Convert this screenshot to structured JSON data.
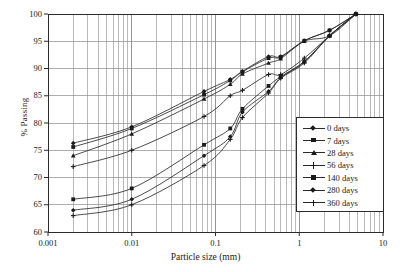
{
  "chart_data": {
    "type": "line",
    "title": "",
    "xlabel": "Particle size (mm)",
    "ylabel": "% Passing",
    "xscale": "log",
    "xlim": [
      0.001,
      10
    ],
    "ylim": [
      60,
      100
    ],
    "yticks": [
      60,
      65,
      70,
      75,
      80,
      85,
      90,
      95,
      100
    ],
    "xticks": [
      0.001,
      0.01,
      0.1,
      1,
      10
    ],
    "xtick_labels": [
      "0.001",
      "0.01",
      "0.1",
      "1",
      "10"
    ],
    "grid": "major-and-minor-log",
    "legend_position": "right-inside",
    "series": [
      {
        "name": "0 days",
        "marker": "diamond",
        "x": [
          0.002,
          0.01,
          0.073,
          0.15,
          0.21,
          0.43,
          0.6,
          1.15,
          2.3,
          4.75
        ],
        "y": [
          76.3,
          79.3,
          85.8,
          88.0,
          89.5,
          92.2,
          92.2,
          95.1,
          97.0,
          100.0
        ]
      },
      {
        "name": "7 days",
        "marker": "square",
        "x": [
          0.002,
          0.01,
          0.073,
          0.15,
          0.21,
          0.43,
          0.6,
          1.15,
          2.3,
          4.75
        ],
        "y": [
          75.6,
          79.0,
          85.2,
          87.8,
          89.4,
          91.9,
          92.1,
          95.1,
          97.0,
          100.0
        ]
      },
      {
        "name": "28 days",
        "marker": "triangle",
        "x": [
          0.002,
          0.01,
          0.073,
          0.15,
          0.21,
          0.43,
          0.6,
          1.15,
          2.3,
          4.75
        ],
        "y": [
          74.0,
          78.0,
          84.4,
          87.1,
          89.0,
          91.0,
          91.8,
          95.0,
          96.0,
          100.0
        ]
      },
      {
        "name": "56 days",
        "marker": "cross",
        "x": [
          0.002,
          0.01,
          0.073,
          0.15,
          0.21,
          0.43,
          0.6,
          1.15,
          2.3,
          4.75
        ],
        "y": [
          72.0,
          75.0,
          81.2,
          85.0,
          86.0,
          88.9,
          88.9,
          91.9,
          96.0,
          100.0
        ]
      },
      {
        "name": "140 days",
        "marker": "square",
        "x": [
          0.002,
          0.01,
          0.073,
          0.15,
          0.21,
          0.43,
          0.6,
          1.15,
          2.3,
          4.75
        ],
        "y": [
          66.0,
          68.0,
          76.0,
          79.0,
          82.6,
          86.8,
          88.5,
          91.3,
          96.0,
          100.0
        ]
      },
      {
        "name": "280 days",
        "marker": "diamond",
        "x": [
          0.002,
          0.01,
          0.073,
          0.15,
          0.21,
          0.43,
          0.6,
          1.15,
          2.3,
          4.75
        ],
        "y": [
          64.0,
          66.0,
          74.0,
          77.5,
          82.0,
          85.8,
          88.3,
          91.2,
          96.0,
          100.0
        ]
      },
      {
        "name": "360 days",
        "marker": "plus",
        "x": [
          0.002,
          0.01,
          0.073,
          0.15,
          0.21,
          0.43,
          0.6,
          1.15,
          2.3,
          4.75
        ],
        "y": [
          63.0,
          65.0,
          72.2,
          77.0,
          81.0,
          85.5,
          88.2,
          91.0,
          96.0,
          100.0
        ]
      }
    ]
  },
  "axes": {
    "y_title": "% Passing",
    "x_title": "Particle size (mm)",
    "y_tick_labels": [
      "100",
      "95",
      "90",
      "85",
      "80",
      "75",
      "70",
      "65",
      "60"
    ],
    "x_tick_labels": [
      "0.001",
      "0.01",
      "0.1",
      "1",
      "10"
    ]
  },
  "legend": {
    "items": [
      {
        "label": "0 days",
        "marker": "diamond"
      },
      {
        "label": "7 days",
        "marker": "square"
      },
      {
        "label": "28 days",
        "marker": "triangle"
      },
      {
        "label": "56 days",
        "marker": "cross"
      },
      {
        "label": "140 days",
        "marker": "square"
      },
      {
        "label": "280 days",
        "marker": "diamond"
      },
      {
        "label": "360 days",
        "marker": "plus"
      }
    ]
  },
  "colors": {
    "line": "#2b2b2b",
    "grid": "#8a8a8a",
    "axis": "#2b2b2b",
    "text": "#1a1a1a",
    "background": "#ffffff"
  }
}
